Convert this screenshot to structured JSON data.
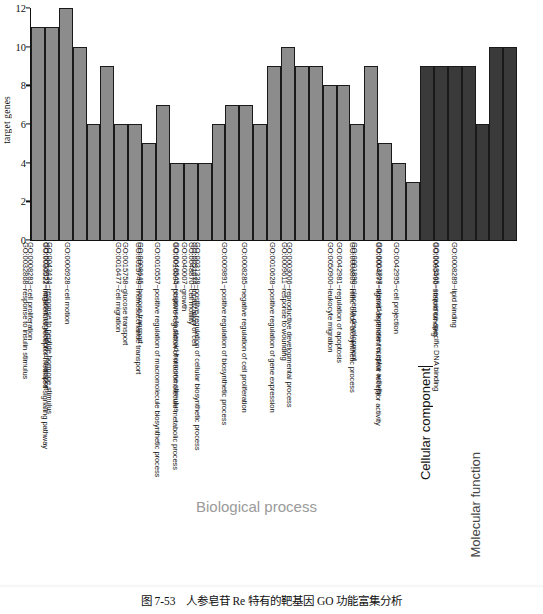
{
  "figure": {
    "caption_number": "图 7-53",
    "caption_text": "人参皂苷 Re 特有的靶基因 GO 功能富集分析"
  },
  "colors": {
    "bar_light": "#8c8c8c",
    "bar_dark": "#3a3a3a",
    "bar_border": "#1a1a1a",
    "axis": "#111111",
    "group_bp_text": "#9a9a9a",
    "group_cc_text": "#111111",
    "group_mf_text": "#444444"
  },
  "groups": {
    "biological_process": "Biological process",
    "cellular_component": "Cellular component",
    "molecular_function": "Molecular function"
  },
  "chart_data": {
    "type": "bar",
    "title": "",
    "xlabel": "",
    "ylabel": "target genes",
    "ylim": [
      0,
      12
    ],
    "yticks": [
      0,
      2,
      4,
      6,
      8,
      10,
      12
    ],
    "grid": false,
    "legend": "none",
    "categories": [
      "GO:0009725~response to hormone stimulus",
      "GO:0009719~response to endogenous stimulus",
      "GO:0010033~response to organic substance",
      "GO:0008283~cell proliferation",
      "GO:0032868~response to insulin stimulus",
      "GO:0006928~cell motion",
      "GO:0051051~negative regulation of transport",
      "GO:0043434~response to peptide hormone stimulus",
      "GO:0030522~intracellular receptor-mediated signaling pathway",
      "GO:0016477~cell migration",
      "GO:0015758~glucose transport",
      "GO:0008645~hexose transport",
      "GO:0015749~monosaccharide transport",
      "GO:0040007~growth",
      "GO:0048870~cell motility",
      "GO:0051674~localization of cell",
      "GO:0048545~response to steroid hormone stimulus",
      "GO:0010557~positive regulation of macromolecule biosynthetic process",
      "GO:0010604~positive regulation of macromolecule metabolic process",
      "GO:0031328~positive regulation of cellular biosynthetic process",
      "GO:0009891~positive regulation of biosynthetic process",
      "GO:0008285~negative regulation of cell proliferation",
      "GO:0009611~response to wounding",
      "GO:0010628~positive regulation of gene expression",
      "GO:0003006~reproductive developmental process",
      "GO:0050900~leukocyte migration",
      "GO:0042981~regulation of apoptosis",
      "GO:0001890~placenta development",
      "GO:0006809~nitric oxide biosynthetic process",
      "GO:0042995~cell projection",
      "GO:0003707~steroid hormone receptor activity",
      "GO:0004879~ligand-dependent nuclear receptor activity",
      "GO:0005496~steroid binding",
      "GO:0008289~lipid binding",
      "GO:0043565~sequence-specific DNA binding"
    ],
    "values": [
      11,
      11,
      12,
      10,
      6,
      9,
      6,
      6,
      5,
      7,
      4,
      4,
      4,
      6,
      7,
      7,
      6,
      9,
      10,
      9,
      9,
      8,
      8,
      6,
      9,
      5,
      4,
      3,
      9,
      9,
      9,
      9,
      6,
      10,
      10
    ],
    "group_of_bar": [
      "biological_process",
      "biological_process",
      "biological_process",
      "biological_process",
      "biological_process",
      "biological_process",
      "biological_process",
      "biological_process",
      "biological_process",
      "biological_process",
      "biological_process",
      "biological_process",
      "biological_process",
      "biological_process",
      "biological_process",
      "biological_process",
      "biological_process",
      "biological_process",
      "biological_process",
      "biological_process",
      "biological_process",
      "biological_process",
      "biological_process",
      "biological_process",
      "biological_process",
      "biological_process",
      "biological_process",
      "biological_process",
      "cellular_component",
      "molecular_function",
      "molecular_function",
      "molecular_function",
      "molecular_function",
      "molecular_function",
      "molecular_function"
    ]
  }
}
